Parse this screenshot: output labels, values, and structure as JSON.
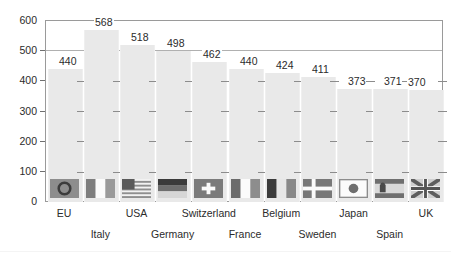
{
  "chart_data": {
    "type": "bar",
    "title": "",
    "subtitle": "",
    "xlabel": "",
    "ylabel": "",
    "ylim": [
      0,
      600
    ],
    "y_ticks": [
      0,
      100,
      200,
      300,
      400,
      500,
      600
    ],
    "grid": true,
    "legend": "none",
    "label_rows": [
      0,
      1,
      0,
      1,
      0,
      1,
      0,
      1,
      0,
      1,
      0
    ],
    "categories": [
      "EU",
      "Italy",
      "USA",
      "Germany",
      "Switzerland",
      "France",
      "Belgium",
      "Sweden",
      "Japan",
      "Spain",
      "UK"
    ],
    "values": [
      440,
      568,
      518,
      498,
      462,
      440,
      424,
      411,
      373,
      371,
      370
    ],
    "flags": [
      "flag-eu-icon",
      "flag-italy-icon",
      "flag-usa-icon",
      "flag-germany-icon",
      "flag-switzerland-icon",
      "flag-france-icon",
      "flag-belgium-icon",
      "flag-sweden-icon",
      "flag-japan-icon",
      "flag-spain-icon",
      "flag-uk-icon"
    ]
  },
  "colors": {
    "bar_fill": "#e9e9e9",
    "grid": "#b0b0b0",
    "frame": "#9a9a9a",
    "text": "#2b2b2b",
    "background": "#ffffff"
  },
  "y_tick_labels": [
    "600",
    "500",
    "400",
    "300",
    "200",
    "100",
    "0"
  ]
}
